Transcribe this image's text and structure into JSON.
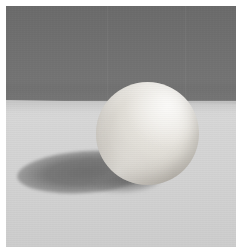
{
  "image": {
    "kind": "photograph",
    "subject": "sphere-still-life",
    "alt_text": "A matte white sphere resting on a pale gray tabletop in front of a darker gray backdrop, casting a soft elliptical shadow to the lower left.",
    "width_px": 236,
    "height_px": 247,
    "border": {
      "name": "white-print-margin",
      "top_px": 6,
      "left_px": 6,
      "right_px": 0,
      "bottom_px": 0,
      "color": "#ffffff"
    }
  },
  "scene": {
    "lighting": {
      "key_light_direction": "upper-right",
      "shadow_direction": "lower-left",
      "quality": "soft-diffuse"
    },
    "horizon": {
      "name": "backdrop-table-horizon",
      "y_left_px": 94,
      "y_right_px": 98,
      "tilt": "slightly-descending-to-right"
    },
    "backdrop": {
      "name": "dark-gray-wall",
      "color_top": "#6b6b6b",
      "color_mid": "#747474",
      "color_bottom": "#6d6d6d",
      "height_px": 95
    },
    "ground": {
      "name": "light-gray-tabletop",
      "color_near_horizon": "#dadada",
      "color_foreground": "#cdcdcd"
    },
    "sphere": {
      "name": "white-sphere",
      "center_x_px": 137,
      "center_y_px": 133,
      "radius_px": 51,
      "highlight_color": "#f4f2ee",
      "midtone_color": "#d0ccc5",
      "terminator_color": "#a8a39b",
      "bounce_light_color": "#f5f4f0",
      "finish": "matte"
    },
    "cast_shadow": {
      "name": "elliptical-cast-shadow",
      "left_px": 17,
      "top_px": 152,
      "width_px": 133,
      "height_px": 38,
      "rotation_deg": -4,
      "core_color": "#6e6e6e",
      "edge_softness": "soft"
    }
  },
  "palette": {
    "backdrop_gray": "#6e6e6e",
    "table_gray": "#d5d5d5",
    "sphere_highlight": "#f2f0ec",
    "sphere_shade": "#b8b6b2",
    "shadow_core": "#7c7c7c",
    "margin_white": "#ffffff"
  }
}
